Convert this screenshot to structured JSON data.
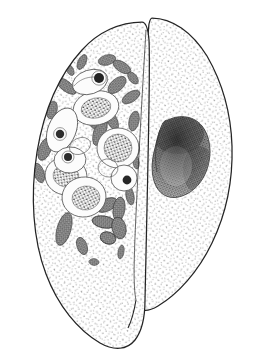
{
  "figure": {
    "caption": "Scientific pen-and-ink stipple illustration of a large amoeboid cell, shown as two overlapping lobes; the left lobe is filled with food vacuoles containing ingested cells and numerous bacterial rods, the right lobe contains a single large dark nucleus.",
    "background_color": "#ffffff",
    "outline_color": "#242424",
    "stipple_color": "#3a3a3a",
    "width": 258,
    "height": 360
  },
  "parts": [
    {
      "id": "left-lobe",
      "label": "Left cell lobe (cytoplasm with food vacuoles)",
      "fill": "#fdfdfd",
      "stipple": "light",
      "outline_width": 1.3
    },
    {
      "id": "right-lobe",
      "label": "Right cell lobe (cytoplasm with nucleus)",
      "fill": "#fdfdfd",
      "stipple": "light",
      "outline_width": 1.3
    },
    {
      "id": "nucleus",
      "label": "Nucleus of right lobe",
      "fill": "#6d6d6d",
      "rim": "#2f2f2f",
      "shape": "kidney-bean"
    },
    {
      "id": "food-vacuole-cluster",
      "label": "Cluster of food vacuoles in left lobe",
      "count": 8,
      "outline": "#4a4a4a"
    },
    {
      "id": "bacteria-cluster",
      "label": "Ingested bacterial rods in left lobe",
      "count": 42,
      "fill": "#8a8a8a"
    }
  ],
  "vacuoles": [
    {
      "cx": 96,
      "cy": 108,
      "rx": 22,
      "ry": 16,
      "rot": -12,
      "content": "granular",
      "granule_count": 60,
      "granule_color": "#3c3c3c"
    },
    {
      "cx": 118,
      "cy": 148,
      "rx": 21,
      "ry": 20,
      "rot": 5,
      "content": "granular",
      "granule_count": 70,
      "granule_color": "#3c3c3c"
    },
    {
      "cx": 70,
      "cy": 175,
      "rx": 20,
      "ry": 18,
      "rot": 10,
      "content": "granular",
      "granule_count": 58,
      "granule_color": "#3c3c3c"
    },
    {
      "cx": 78,
      "cy": 193,
      "rx": 22,
      "ry": 20,
      "rot": -8,
      "content": "granular",
      "granule_count": 62,
      "granule_color": "#3c3c3c"
    },
    {
      "cx": 62,
      "cy": 128,
      "rx": 14,
      "ry": 22,
      "rot": 22,
      "content": "nucleated",
      "nucleus_r": 4
    },
    {
      "cx": 68,
      "cy": 160,
      "rx": 15,
      "ry": 13,
      "rot": -5,
      "content": "nucleated",
      "nucleus_r": 4
    },
    {
      "cx": 123,
      "cy": 178,
      "rx": 13,
      "ry": 13,
      "rot": 0,
      "content": "nucleated",
      "nucleus_r": 4
    },
    {
      "cx": 90,
      "cy": 82,
      "rx": 17,
      "ry": 12,
      "rot": -20,
      "content": "nucleated",
      "nucleus_r": 5
    }
  ],
  "rods": [
    {
      "cx": 82,
      "cy": 62,
      "rx": 4,
      "ry": 8,
      "rot": 25,
      "tone": "#7d7d7d"
    },
    {
      "cx": 107,
      "cy": 60,
      "rx": 8,
      "ry": 5,
      "rot": -15,
      "tone": "#8f8f8f"
    },
    {
      "cx": 120,
      "cy": 66,
      "rx": 9,
      "ry": 5,
      "rot": 30,
      "tone": "#6a6a6a"
    },
    {
      "cx": 66,
      "cy": 85,
      "rx": 11,
      "ry": 5,
      "rot": 35,
      "tone": "#5e5e5e"
    },
    {
      "cx": 117,
      "cy": 84,
      "rx": 10,
      "ry": 6,
      "rot": -40,
      "tone": "#7a7a7a"
    },
    {
      "cx": 132,
      "cy": 78,
      "rx": 7,
      "ry": 4,
      "rot": 50,
      "tone": "#8a8a8a"
    },
    {
      "cx": 130,
      "cy": 96,
      "rx": 9,
      "ry": 5,
      "rot": -30,
      "tone": "#747474"
    },
    {
      "cx": 52,
      "cy": 110,
      "rx": 5,
      "ry": 9,
      "rot": 15,
      "tone": "#808080"
    },
    {
      "cx": 45,
      "cy": 148,
      "rx": 6,
      "ry": 11,
      "rot": 20,
      "tone": "#6f6f6f"
    },
    {
      "cx": 38,
      "cy": 172,
      "rx": 5,
      "ry": 10,
      "rot": -18,
      "tone": "#8b8b8b"
    },
    {
      "cx": 100,
      "cy": 130,
      "rx": 6,
      "ry": 14,
      "rot": 18,
      "tone": "#6b6b6b"
    },
    {
      "cx": 112,
      "cy": 120,
      "rx": 5,
      "ry": 11,
      "rot": -25,
      "tone": "#838383"
    },
    {
      "cx": 133,
      "cy": 120,
      "rx": 5,
      "ry": 10,
      "rot": 12,
      "tone": "#777777"
    },
    {
      "cx": 96,
      "cy": 196,
      "rx": 6,
      "ry": 11,
      "rot": 12,
      "tone": "#5c5c5c"
    },
    {
      "cx": 106,
      "cy": 205,
      "rx": 10,
      "ry": 6,
      "rot": -28,
      "tone": "#555555"
    },
    {
      "cx": 118,
      "cy": 208,
      "rx": 6,
      "ry": 12,
      "rot": 8,
      "tone": "#6c6c6c"
    },
    {
      "cx": 104,
      "cy": 222,
      "rx": 11,
      "ry": 6,
      "rot": 10,
      "tone": "#4f4f4f"
    },
    {
      "cx": 118,
      "cy": 228,
      "rx": 7,
      "ry": 11,
      "rot": -12,
      "tone": "#585858"
    },
    {
      "cx": 108,
      "cy": 238,
      "rx": 8,
      "ry": 6,
      "rot": 20,
      "tone": "#444444"
    },
    {
      "cx": 64,
      "cy": 228,
      "rx": 7,
      "ry": 16,
      "rot": 16,
      "tone": "#7b7b7b"
    },
    {
      "cx": 82,
      "cy": 245,
      "rx": 5,
      "ry": 9,
      "rot": -20,
      "tone": "#8a8a8a"
    },
    {
      "cx": 94,
      "cy": 262,
      "rx": 5,
      "ry": 4,
      "rot": 0,
      "tone": "#9a9a9a"
    },
    {
      "cx": 120,
      "cy": 252,
      "rx": 3,
      "ry": 7,
      "rot": 10,
      "tone": "#8d8d8d"
    },
    {
      "cx": 136,
      "cy": 160,
      "rx": 3,
      "ry": 7,
      "rot": -8,
      "tone": "#6e6e6e"
    },
    {
      "cx": 136,
      "cy": 148,
      "rx": 3,
      "ry": 6,
      "rot": 5,
      "tone": "#7c7c7c"
    }
  ]
}
